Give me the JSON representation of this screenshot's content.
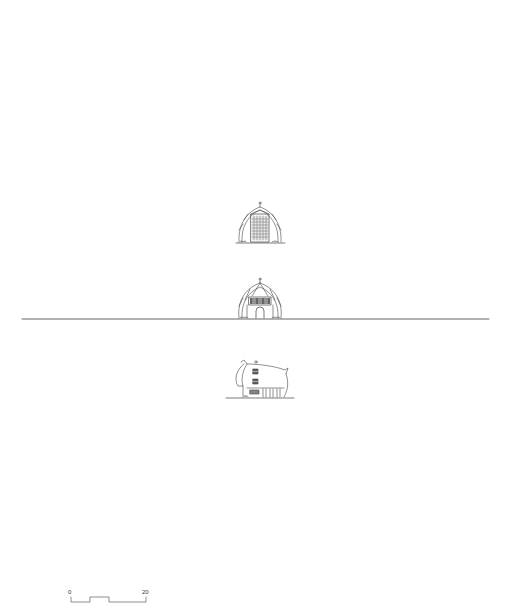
{
  "drawing": {
    "type": "architectural elevations sheet",
    "background": "#ffffff",
    "line_color": "#444444",
    "ground_line": {
      "x1": 22,
      "x2": 489,
      "y": 319,
      "color": "#555555"
    },
    "elevations": [
      {
        "id": "elevation-1",
        "description": "front elevation, dome roof with tall gridded window tower",
        "center_x": 260,
        "base_y": 243
      },
      {
        "id": "elevation-2",
        "description": "front elevation, dome roof with window band and arched door",
        "center_x": 260,
        "base_y": 319
      },
      {
        "id": "elevation-3",
        "description": "side elevation, curved roof with stacked windows and colonnade",
        "center_x": 260,
        "base_y": 398
      }
    ]
  },
  "scale_bar": {
    "start_label": "0",
    "end_label": "20"
  }
}
